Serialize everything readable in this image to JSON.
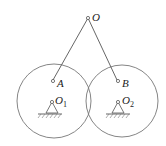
{
  "diagram": {
    "labels": {
      "O": "O",
      "A": "A",
      "B": "B",
      "O1": "O",
      "O1_sub": "1",
      "O2": "O",
      "O2_sub": "2"
    },
    "colors": {
      "stroke": "#555555",
      "text": "#222222",
      "background": "#ffffff"
    }
  }
}
